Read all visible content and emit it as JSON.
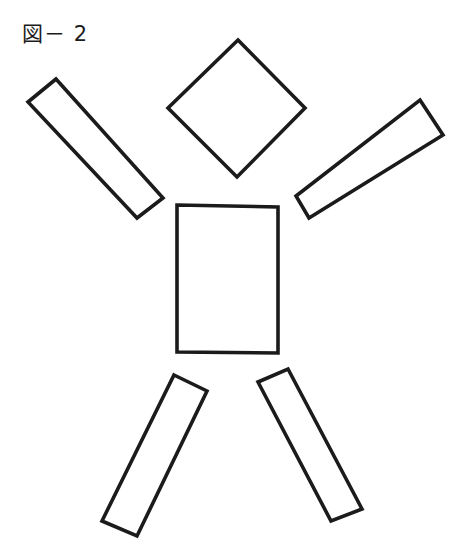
{
  "page": {
    "width": 466,
    "height": 553,
    "background_color": "#ffffff",
    "ink_color": "#1b1b1b"
  },
  "caption": {
    "text": "図－ 2",
    "figure_word": "図",
    "dash": "－",
    "number": "2"
  },
  "figure": {
    "stroke_width": 3.6,
    "parts": [
      {
        "name": "head",
        "label": "head-diamond",
        "shape": "diamond",
        "points": "238,40 305,108 237,177 168,108"
      },
      {
        "name": "torso",
        "label": "torso-rectangle",
        "shape": "rectangle",
        "points": "177,205 278,207 278,353 177,352"
      },
      {
        "name": "left-arm",
        "label": "left-arm-bar",
        "shape": "rotated-bar",
        "points": "56,79 28,102 137,218 163,198"
      },
      {
        "name": "right-arm",
        "label": "right-arm-bar",
        "shape": "rotated-bar",
        "points": "420,100 443,135 309,218 296,196"
      },
      {
        "name": "left-leg",
        "label": "left-leg-bar",
        "shape": "rotated-bar",
        "points": "174,375 207,391 137,536 102,521"
      },
      {
        "name": "right-leg",
        "label": "right-leg-bar",
        "shape": "rotated-bar",
        "points": "288,369 362,509 331,521 258,382"
      }
    ]
  }
}
